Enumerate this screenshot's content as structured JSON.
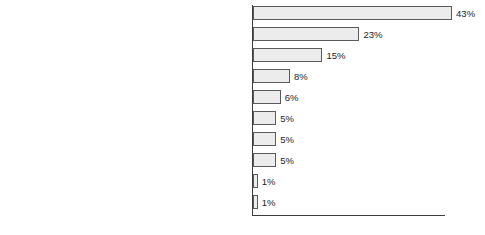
{
  "chart_data": {
    "type": "bar",
    "orientation": "horizontal",
    "title": "",
    "subtitle": "",
    "xlabel": "",
    "ylabel": "",
    "xlim": [
      0,
      43
    ],
    "grid": false,
    "legend": null,
    "value_suffix": "%",
    "categories": [
      "I haven't had time",
      "I haven't thought about it",
      "They are difficult to get to",
      "The cost of the day out (travel, food and drink etc.)",
      "I am not interested in the subjects",
      "I never go to museums",
      "I haven't seen any marketing/advertising",
      "My family/children aren't interested in the subjects",
      "They're not children-friendly",
      "I don't know what's in them"
    ],
    "values": [
      43,
      23,
      15,
      8,
      6,
      5,
      5,
      5,
      1,
      1
    ],
    "value_labels": [
      "43%",
      "23%",
      "15%",
      "8%",
      "6%",
      "5%",
      "5%",
      "5%",
      "1%",
      "1%"
    ],
    "colors": {
      "bar_fill": "#ececec",
      "bar_border": "#5a5a5a",
      "axis": "#3c3c3c",
      "text": "#1c1c1c",
      "background": "#ffffff"
    }
  }
}
